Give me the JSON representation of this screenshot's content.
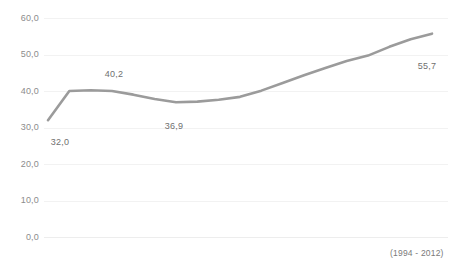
{
  "chart_data": {
    "type": "line",
    "title": "",
    "subtitle": "",
    "caption": "(1994 - 2012)",
    "xlabel": "",
    "ylabel": "",
    "ylim": [
      0,
      60
    ],
    "xlim": [
      1994,
      2012
    ],
    "grid": true,
    "legend": false,
    "legend_position": "none",
    "line_color": "#9b9b9b",
    "x": [
      1994,
      1995,
      1996,
      1997,
      1998,
      1999,
      2000,
      2001,
      2002,
      2003,
      2004,
      2005,
      2006,
      2007,
      2008,
      2009,
      2010,
      2011,
      2012
    ],
    "categories": [
      "1994",
      "1995",
      "1996",
      "1997",
      "1998",
      "1999",
      "2000",
      "2001",
      "2002",
      "2003",
      "2004",
      "2005",
      "2006",
      "2007",
      "2008",
      "2009",
      "2010",
      "2011",
      "2012"
    ],
    "values": [
      32.0,
      40.0,
      40.2,
      40.0,
      39.0,
      37.8,
      36.9,
      37.1,
      37.6,
      38.4,
      40.1,
      42.2,
      44.3,
      46.3,
      48.2,
      49.7,
      52.1,
      54.2,
      55.7
    ],
    "series": [
      {
        "name": "value",
        "color": "#9b9b9b",
        "values": [
          32.0,
          40.0,
          40.2,
          40.0,
          39.0,
          37.8,
          36.9,
          37.1,
          37.6,
          38.4,
          40.1,
          42.2,
          44.3,
          46.3,
          48.2,
          49.7,
          52.1,
          54.2,
          55.7
        ]
      }
    ],
    "yticks": [
      60.0,
      50.0,
      40.0,
      30.0,
      20.0,
      10.0,
      0.0
    ],
    "ytick_labels": [
      "60,0",
      "50,0",
      "40,0",
      "30,0",
      "20,0",
      "10,0",
      "0,0"
    ],
    "xticks": [],
    "xtick_labels": [],
    "annotations": [
      {
        "label": "32,0",
        "x": 1994,
        "y": 32.0,
        "px": 60,
        "py": 142
      },
      {
        "label": "40,2",
        "x": 1996,
        "y": 40.2,
        "px": 114,
        "py": 74
      },
      {
        "label": "36,9",
        "x": 2000,
        "y": 36.9,
        "px": 174,
        "py": 126
      },
      {
        "label": "55,7",
        "x": 2012,
        "y": 55.7,
        "px": 427,
        "py": 66
      }
    ]
  },
  "axis": {
    "ytick_labels": [
      "60,0",
      "50,0",
      "40,0",
      "30,0",
      "20,0",
      "10,0",
      "0,0"
    ]
  },
  "footer": {
    "caption": "(1994 - 2012)"
  },
  "header": {
    "clipped_title": ""
  }
}
